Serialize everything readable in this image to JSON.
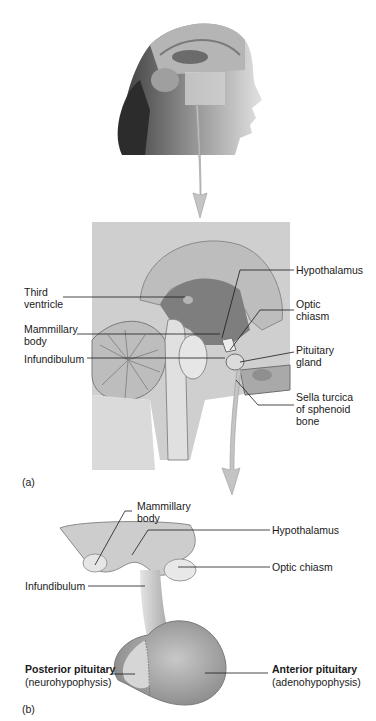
{
  "panel_a": {
    "label": "(a)",
    "labels": {
      "third_ventricle": "Third\nventricle",
      "mammillary_body": "Mammillary\nbody",
      "infundibulum": "Infundibulum",
      "hypothalamus": "Hypothalamus",
      "optic_chiasm": "Optic\nchiasm",
      "pituitary_gland": "Pituitary\ngland",
      "sella_turcica": "Sella turcica\nof sphenoid\nbone"
    }
  },
  "panel_b": {
    "label": "(b)",
    "labels": {
      "mammillary_body": "Mammillary\nbody",
      "hypothalamus": "Hypothalamus",
      "optic_chiasm": "Optic chiasm",
      "infundibulum": "Infundibulum",
      "posterior_pituitary": "Posterior pituitary",
      "posterior_sub": "(neurohypophysis)",
      "anterior_pituitary": "Anterior pituitary",
      "anterior_sub": "(adenohypophysis)"
    }
  },
  "colors": {
    "background": "#ffffff",
    "tissue_light": "#d9d9d9",
    "tissue_mid": "#a8a8a8",
    "tissue_dark": "#6e6e6e",
    "arrow": "#c4c4c4",
    "leader": "#1a1a1a"
  }
}
